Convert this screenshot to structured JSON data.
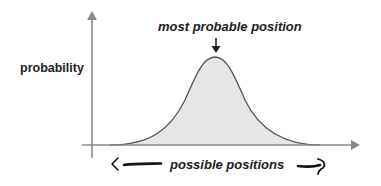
{
  "diagram": {
    "peak_label": "most probable position",
    "y_axis_label": "probability",
    "x_axis_label": "possible positions",
    "colors": {
      "axis": "#8a8a8a",
      "curve_stroke": "#555555",
      "curve_fill": "#e6e6e6",
      "text": "#222222",
      "hand_arrows": "#111111"
    },
    "icons": {
      "peak_marker": "down-arrow-icon",
      "left_range": "left-hand-drawn-arrow-icon",
      "right_range": "right-hand-drawn-arrow-icon"
    }
  }
}
